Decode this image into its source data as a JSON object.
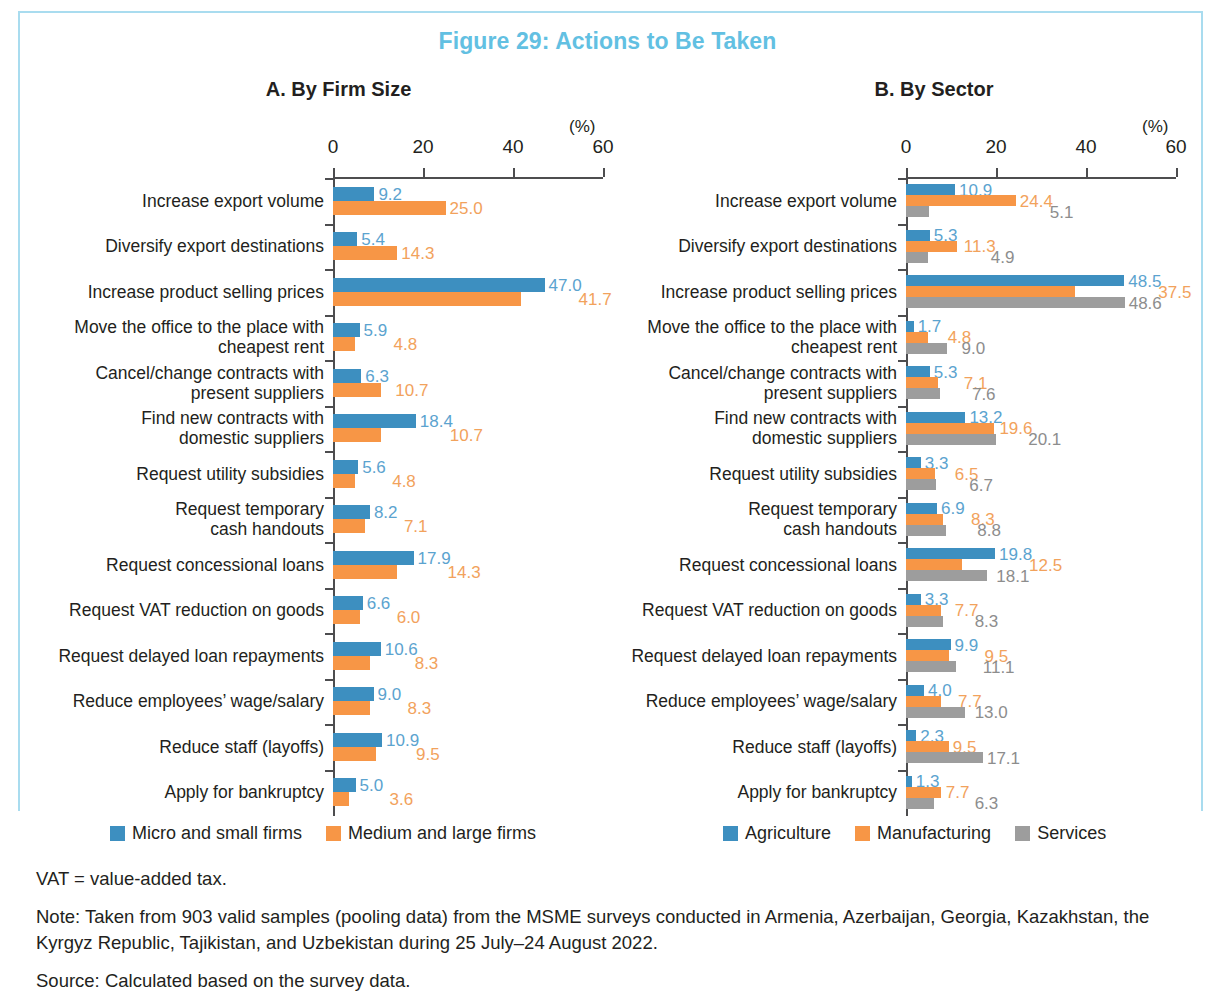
{
  "figure": {
    "title": "Figure 29: Actions to Be Taken",
    "title_color": "#62c0e2",
    "frame_color": "#a9dcef"
  },
  "colors": {
    "blue": "#3d8fc0",
    "orange": "#f79646",
    "gray": "#9d9d9d",
    "blue_label": "#5ba3cf",
    "orange_label": "#f2a25c",
    "gray_label": "#8d8d8d",
    "axis": "#4d4d4f"
  },
  "axis": {
    "unit": "(%)",
    "ticks": [
      "0",
      "20",
      "40",
      "60"
    ],
    "min": 0,
    "max": 60
  },
  "categories": [
    "Increase export volume",
    "Diversify export destinations",
    "Increase product selling prices",
    "Move the office to the place with\ncheapest rent",
    "Cancel/change contracts with\npresent suppliers",
    "Find new contracts with\ndomestic suppliers",
    "Request utility subsidies",
    "Request temporary\ncash handouts",
    "Request concessional loans",
    "Request VAT reduction on goods",
    "Request delayed loan repayments",
    "Reduce employees’ wage/salary",
    "Reduce staff (layoffs)",
    "Apply for bankruptcy"
  ],
  "chart_data": [
    {
      "type": "bar",
      "title": "A. By Firm Size",
      "orientation": "horizontal",
      "xlabel": "(%)",
      "ylabel": "",
      "xlim": [
        0,
        60
      ],
      "xticks": [
        0,
        20,
        40,
        60
      ],
      "grid": false,
      "legend_position": "bottom",
      "categories": [
        "Increase export volume",
        "Diversify export destinations",
        "Increase product selling prices",
        "Move the office to the place with cheapest rent",
        "Cancel/change contracts with present suppliers",
        "Find new contracts with domestic suppliers",
        "Request utility subsidies",
        "Request temporary cash handouts",
        "Request concessional loans",
        "Request VAT reduction on goods",
        "Request delayed loan repayments",
        "Reduce employees’ wage/salary",
        "Reduce staff (layoffs)",
        "Apply for bankruptcy"
      ],
      "series": [
        {
          "name": "Micro and small firms",
          "color": "#3d8fc0",
          "values": [
            9.2,
            5.4,
            47.0,
            5.9,
            6.3,
            18.4,
            5.6,
            8.2,
            17.9,
            6.6,
            10.6,
            9.0,
            10.9,
            5.0
          ]
        },
        {
          "name": "Medium and large firms",
          "color": "#f79646",
          "values": [
            25.0,
            14.3,
            41.7,
            4.8,
            10.7,
            10.7,
            4.8,
            7.1,
            14.3,
            6.0,
            8.3,
            8.3,
            9.5,
            3.6
          ]
        }
      ]
    },
    {
      "type": "bar",
      "title": "B. By Sector",
      "orientation": "horizontal",
      "xlabel": "(%)",
      "ylabel": "",
      "xlim": [
        0,
        60
      ],
      "xticks": [
        0,
        20,
        40,
        60
      ],
      "grid": false,
      "legend_position": "bottom",
      "categories": [
        "Increase export volume",
        "Diversify export destinations",
        "Increase product selling prices",
        "Move the office to the place with cheapest rent",
        "Cancel/change contracts with present suppliers",
        "Find new contracts with domestic suppliers",
        "Request utility subsidies",
        "Request temporary cash handouts",
        "Request concessional loans",
        "Request VAT reduction on goods",
        "Request delayed loan repayments",
        "Reduce employees’ wage/salary",
        "Reduce staff (layoffs)",
        "Apply for bankruptcy"
      ],
      "series": [
        {
          "name": "Agriculture",
          "color": "#3d8fc0",
          "values": [
            10.9,
            5.3,
            48.5,
            1.7,
            5.3,
            13.2,
            3.3,
            6.9,
            19.8,
            3.3,
            9.9,
            4.0,
            2.3,
            1.3
          ]
        },
        {
          "name": "Manufacturing",
          "color": "#f79646",
          "values": [
            24.4,
            11.3,
            37.5,
            4.8,
            7.1,
            19.6,
            6.5,
            8.3,
            12.5,
            7.7,
            9.5,
            7.7,
            9.5,
            7.7
          ]
        },
        {
          "name": "Services",
          "color": "#9d9d9d",
          "values": [
            5.1,
            4.9,
            48.6,
            9.0,
            7.6,
            20.1,
            6.7,
            8.8,
            18.1,
            8.3,
            11.1,
            13.0,
            17.1,
            6.3
          ]
        }
      ]
    }
  ],
  "notes": [
    "VAT = value-added tax.",
    "Note: Taken from 903 valid samples (pooling data) from the MSME surveys conducted in Armenia, Azerbaijan, Georgia, Kazakhstan, the Kyrgyz Republic, Tajikistan, and Uzbekistan during 25 July–24 August 2022.",
    "Source: Calculated based on the survey data."
  ]
}
